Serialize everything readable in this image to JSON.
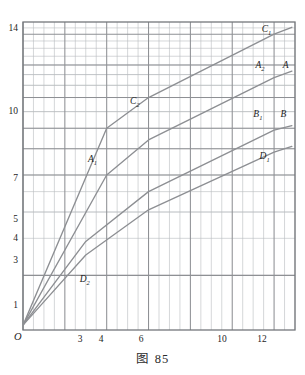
{
  "figure": {
    "caption_label": "图",
    "caption_number": "85",
    "origin_label": "O"
  },
  "chart_data": {
    "type": "line",
    "xlabel": "",
    "ylabel": "",
    "x_scale": "linear",
    "y_scale": "log",
    "grid": true,
    "grid_major": true,
    "grid_minor": true,
    "legend": "none",
    "xlim": [
      0,
      13
    ],
    "ylim": [
      0.55,
      16
    ],
    "xticks": [
      3,
      4,
      6,
      10,
      12
    ],
    "xtick_labels": [
      "3",
      "4",
      "6",
      "10",
      "12"
    ],
    "yticks": [
      1,
      3,
      4,
      5,
      7,
      10,
      14
    ],
    "ytick_labels": [
      "1",
      "3",
      "4",
      "5",
      "7",
      "10",
      "14"
    ],
    "line_color": "#8d8f93",
    "axis_color": "#6f7276",
    "grid_color_major": "#8e9094",
    "grid_color_minor": "#b9bcc0",
    "series": [
      {
        "name": "C",
        "points": [
          [
            0,
            0.58
          ],
          [
            4,
            5.0
          ],
          [
            6,
            7.0
          ],
          [
            12,
            14.0
          ],
          [
            12.85,
            15.1
          ]
        ],
        "annotations": [
          {
            "text": "C",
            "sub": "2",
            "x": 5.3,
            "y": 6.3
          },
          {
            "text": "C",
            "sub": "1",
            "x": 11.6,
            "y": 13.9
          }
        ]
      },
      {
        "name": "A",
        "points": [
          [
            0,
            0.58
          ],
          [
            4,
            3.0
          ],
          [
            6,
            4.4
          ],
          [
            12,
            8.7
          ],
          [
            12.85,
            9.35
          ]
        ],
        "annotations": [
          {
            "text": "A",
            "sub": "1",
            "x": 3.3,
            "y": 3.35
          },
          {
            "text": "A",
            "sub": "2",
            "x": 11.3,
            "y": 9.4
          },
          {
            "text": "A",
            "sub": "",
            "x": 12.6,
            "y": 9.4
          }
        ]
      },
      {
        "name": "B",
        "points": [
          [
            0,
            0.58
          ],
          [
            3,
            1.45
          ],
          [
            6,
            2.5
          ],
          [
            12,
            4.9
          ],
          [
            12.85,
            5.15
          ]
        ],
        "annotations": [
          {
            "text": "B",
            "sub": "1",
            "x": 11.2,
            "y": 5.45
          },
          {
            "text": "B",
            "sub": "",
            "x": 12.5,
            "y": 5.45
          }
        ]
      },
      {
        "name": "D",
        "points": [
          [
            0,
            0.58
          ],
          [
            3,
            1.25
          ],
          [
            6,
            2.05
          ],
          [
            12,
            3.85
          ],
          [
            12.85,
            4.1
          ]
        ],
        "annotations": [
          {
            "text": "D",
            "sub": "2",
            "x": 2.9,
            "y": 0.9
          },
          {
            "text": "D",
            "sub": "1",
            "x": 11.5,
            "y": 3.45
          }
        ]
      }
    ]
  },
  "axes": {
    "y_tick_values": [
      {
        "label": "14",
        "px": 30
      },
      {
        "label": "10",
        "px": 113
      },
      {
        "label": "7",
        "px": 180
      },
      {
        "label": "5",
        "px": 221
      },
      {
        "label": "4",
        "px": 240
      },
      {
        "label": "3",
        "px": 262
      },
      {
        "label": "1",
        "px": 307
      }
    ],
    "x_tick_values": [
      {
        "label": "3",
        "px": 80
      },
      {
        "label": "4",
        "px": 101
      },
      {
        "label": "6",
        "px": 141
      },
      {
        "label": "10",
        "px": 222
      },
      {
        "label": "12",
        "px": 262
      }
    ]
  }
}
